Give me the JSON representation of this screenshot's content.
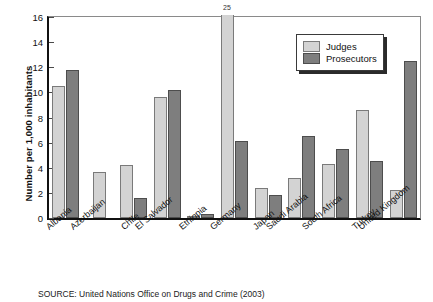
{
  "chart_data": {
    "type": "bar",
    "title": "",
    "xlabel": "",
    "ylabel": "Number per 1,000 inhabitants",
    "ylim": [
      0,
      16
    ],
    "yticks": [
      0,
      2,
      4,
      6,
      8,
      10,
      12,
      14,
      16
    ],
    "ytick_labels": [
      "0",
      "2",
      "4",
      "6",
      "8",
      "10",
      "12",
      "14",
      "16"
    ],
    "grid": false,
    "legend_position": "upper-right",
    "categories": [
      "Albania",
      "Azerbaijan",
      "Chile",
      "El Salvador",
      "Ethiopia",
      "Germany",
      "Japan",
      "Saudi Arabia",
      "South Africa",
      "Turkey",
      "United Kingdom"
    ],
    "series": [
      {
        "name": "Judges",
        "color": "#d3d3d3",
        "values": [
          10.5,
          3.7,
          4.2,
          9.6,
          0.15,
          25,
          2.4,
          3.2,
          4.3,
          8.6,
          2.2
        ]
      },
      {
        "name": "Prosecutors",
        "color": "#7e7e7e",
        "values": [
          11.8,
          null,
          1.6,
          10.2,
          0.3,
          6.1,
          1.8,
          6.5,
          5.5,
          4.5,
          12.5
        ]
      }
    ],
    "annotations": [
      {
        "text": "25",
        "series": "Judges",
        "category": "Germany",
        "note": "value exceeds axis maximum; bar is clipped at top of plot"
      }
    ]
  },
  "legend": {
    "items": [
      {
        "label": "Judges",
        "color": "#d3d3d3"
      },
      {
        "label": "Prosecutors",
        "color": "#7e7e7e"
      }
    ]
  },
  "source": {
    "text": "SOURCE: United Nations Office on Drugs and Crime (2003)"
  }
}
